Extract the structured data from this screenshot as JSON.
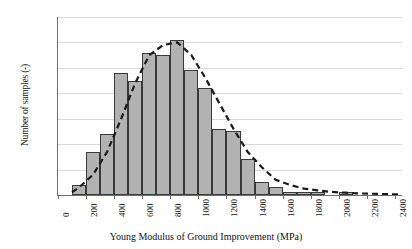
{
  "chart_data": {
    "type": "bar",
    "title": "",
    "xlabel": "Young Modulus of Ground Improvement (MPa)",
    "ylabel": "Number of samples (-)",
    "grid": true,
    "legend": null,
    "xlim": [
      0,
      2450
    ],
    "ylim": [
      0,
      70
    ],
    "bin_width": 100,
    "x_tick_labels": [
      "0",
      "200",
      "400",
      "600",
      "800",
      "1000",
      "1200",
      "1400",
      "1600",
      "1800",
      "2000",
      "2200",
      "2400"
    ],
    "x_tick_values": [
      0,
      200,
      400,
      600,
      800,
      1000,
      1200,
      1400,
      1600,
      1800,
      2000,
      2200,
      2400
    ],
    "y_tick_labels": [
      "0",
      "10",
      "20",
      "30",
      "40",
      "50",
      "60",
      "70"
    ],
    "y_tick_values": [
      0,
      10,
      20,
      30,
      40,
      50,
      60,
      70
    ],
    "categories": [
      "150",
      "250",
      "350",
      "450",
      "550",
      "650",
      "750",
      "850",
      "950",
      "1050",
      "1150",
      "1250",
      "1350",
      "1450",
      "1550",
      "1650",
      "1750",
      "1850",
      "1950",
      "2050",
      "2150",
      "2250",
      "2350",
      "2450"
    ],
    "bin_starts": [
      100,
      200,
      300,
      400,
      500,
      600,
      700,
      800,
      900,
      1000,
      1100,
      1200,
      1300,
      1400,
      1500,
      1600,
      1700,
      1800,
      1900,
      2000,
      2100,
      2200,
      2300,
      2400
    ],
    "values": [
      4,
      17,
      24,
      48,
      45,
      56,
      55,
      61,
      49,
      42,
      26,
      25,
      14,
      5,
      3,
      1,
      1,
      1,
      0,
      1,
      0,
      0,
      0,
      0
    ],
    "series": [
      {
        "name": "Number of samples",
        "values": [
          4,
          17,
          24,
          48,
          45,
          56,
          55,
          61,
          49,
          42,
          26,
          25,
          14,
          5,
          3,
          1,
          1,
          1,
          0,
          1,
          0,
          0,
          0,
          0
        ]
      }
    ],
    "fit_curve": {
      "name": "fitted distribution",
      "style": "dashed",
      "x": [
        100,
        150,
        250,
        350,
        450,
        550,
        650,
        750,
        850,
        950,
        1050,
        1150,
        1250,
        1350,
        1450,
        1550,
        1650,
        1750,
        1850,
        1950,
        2050,
        2150,
        2300,
        2450
      ],
      "y": [
        1,
        3,
        8,
        17,
        30,
        44,
        55,
        59,
        60,
        55,
        46,
        36,
        26,
        17,
        11,
        6,
        4,
        2.5,
        1.8,
        1.2,
        0.9,
        0.6,
        0.4,
        0.2
      ]
    },
    "colors": {
      "bar_fill": "#b2b2b2",
      "bar_edge": "#3a3a3a",
      "grid": "#d9d9d9",
      "axis": "#6e6e6e",
      "curve": "#1a1a1a",
      "text": "#111111",
      "background": "#ffffff"
    }
  }
}
